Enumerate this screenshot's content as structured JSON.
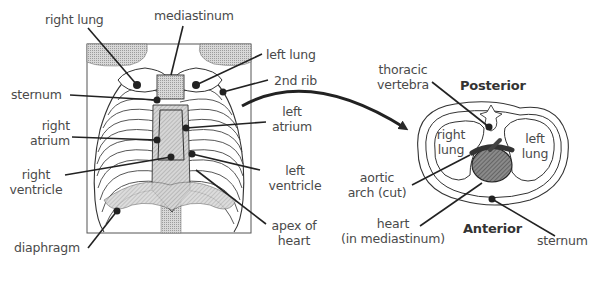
{
  "front_view": {
    "labels": {
      "right_lung": "right lung",
      "mediastinum": "mediastinum",
      "left_lung": "left lung",
      "second_rib": "2nd rib",
      "sternum": "sternum",
      "left_atrium_1": "left",
      "left_atrium_2": "atrium",
      "right_atrium_1": "right",
      "right_atrium_2": "atrium",
      "right_ventricle_1": "right",
      "right_ventricle_2": "ventricle",
      "left_ventricle_1": "left",
      "left_ventricle_2": "ventricle",
      "apex_1": "apex of",
      "apex_2": "heart",
      "diaphragm": "diaphragm"
    }
  },
  "cross_section": {
    "orientation": {
      "top": "Posterior",
      "bottom": "Anterior"
    },
    "labels": {
      "thoracic_vertebra_1": "thoracic",
      "thoracic_vertebra_2": "vertebra",
      "right_lung_1": "right",
      "right_lung_2": "lung",
      "left_lung_1": "left",
      "left_lung_2": "lung",
      "aortic_arch_1": "aortic",
      "aortic_arch_2": "arch (cut)",
      "heart_1": "heart",
      "heart_2": "(in mediastinum)",
      "sternum": "sternum"
    }
  },
  "colors": {
    "line": "#2a2a2a",
    "shade": "#c8c8c8",
    "dark_shade": "#777777",
    "text": "#4a4a4a"
  }
}
